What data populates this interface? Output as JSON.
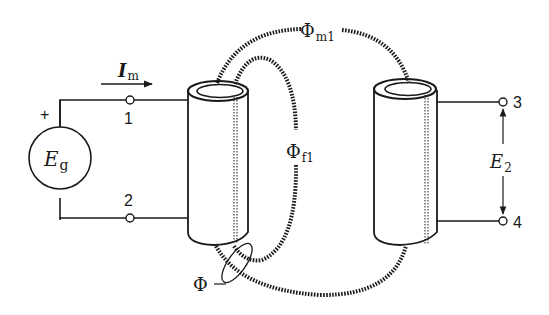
{
  "diagram": {
    "colors": {
      "ink": "#1a1a1a",
      "background": "#ffffff"
    },
    "source": {
      "label_main": "E",
      "label_sub": "g",
      "polarity": "+"
    },
    "current": {
      "label_main": "I",
      "label_sub": "m"
    },
    "terminals": [
      "1",
      "2",
      "3",
      "4"
    ],
    "output_voltage": {
      "label_main": "E",
      "label_sub": "2"
    },
    "flux_mutual": {
      "label_main": "Φ",
      "label_sub": "m1"
    },
    "flux_leakage": {
      "label_main": "Φ",
      "label_sub": "f1"
    },
    "flux_total": {
      "label_main": "Φ"
    }
  }
}
